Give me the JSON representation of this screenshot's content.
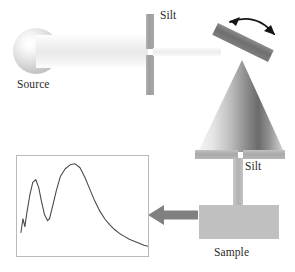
{
  "figure": {
    "width": 295,
    "height": 272,
    "background": "#ffffff"
  },
  "labels": {
    "source": "Source",
    "slit_top": "Silt",
    "slit_bottom": "Silt",
    "sample": "Sample"
  },
  "components": {
    "source_sphere": {
      "name": "light-source-sphere",
      "shape": "sphere",
      "highlight_color": "#ffffff",
      "edge_color": "#bdbdbd"
    },
    "incident_beam": {
      "name": "incident-light-beam",
      "shape": "band",
      "color": "#ededed"
    },
    "slit_top": {
      "name": "entrance-slit",
      "orientation": "vertical",
      "segments": 2,
      "color": "#9e9e9e"
    },
    "narrow_beam": {
      "name": "collimated-beam",
      "color": "#ececec"
    },
    "grating": {
      "name": "rotating-grating",
      "orientation_degrees": 26,
      "color": "#6f6f6f"
    },
    "rotation_arrow": {
      "name": "rotation-double-arrow",
      "style": "curved double-headed",
      "color": "#1a1a1a"
    },
    "dispersion_cone": {
      "name": "dispersed-light-cone",
      "shape": "triangle",
      "gradient_light": "#f4f4f4",
      "gradient_dark": "#636363"
    },
    "slit_bottom": {
      "name": "exit-slit",
      "orientation": "horizontal",
      "segments": 2,
      "color": "#a9a9a9"
    },
    "column": {
      "name": "beam-column",
      "color": "#b1b1b1"
    },
    "sample_block": {
      "name": "sample-block",
      "color": "#c0c0c0"
    },
    "output_arrow": {
      "name": "signal-output-arrow",
      "direction": "left",
      "color": "#7f7f7f"
    }
  },
  "chart_data": {
    "type": "line",
    "title": "",
    "xlabel": "",
    "ylabel": "",
    "xlim": [
      0,
      133
    ],
    "ylim": [
      0,
      102
    ],
    "grid": false,
    "legend": null,
    "frame_color": "#b9b9b9",
    "line_color": "#4a4a4a",
    "series": [
      {
        "name": "spectrum",
        "points": [
          [
            4,
            78
          ],
          [
            6,
            64
          ],
          [
            8,
            72
          ],
          [
            10,
            58
          ],
          [
            13,
            40
          ],
          [
            16,
            27
          ],
          [
            19,
            24
          ],
          [
            22,
            32
          ],
          [
            25,
            47
          ],
          [
            28,
            60
          ],
          [
            31,
            66
          ],
          [
            33,
            64
          ],
          [
            36,
            52
          ],
          [
            40,
            35
          ],
          [
            44,
            21
          ],
          [
            49,
            13
          ],
          [
            54,
            9
          ],
          [
            59,
            8
          ],
          [
            64,
            12
          ],
          [
            69,
            22
          ],
          [
            74,
            34
          ],
          [
            79,
            46
          ],
          [
            84,
            56
          ],
          [
            89,
            64
          ],
          [
            94,
            70
          ],
          [
            99,
            75
          ],
          [
            104,
            79
          ],
          [
            109,
            82
          ],
          [
            114,
            85
          ],
          [
            119,
            87
          ],
          [
            124,
            89
          ],
          [
            129,
            91
          ],
          [
            133,
            92
          ]
        ]
      }
    ]
  }
}
